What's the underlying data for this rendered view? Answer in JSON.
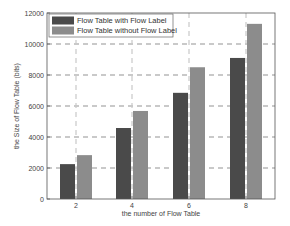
{
  "chart_data": {
    "type": "bar",
    "title": "",
    "xlabel": "the number of Flow Table",
    "ylabel": "the Size of Flow Table (bits)",
    "categories": [
      "2",
      "4",
      "6",
      "8"
    ],
    "series": [
      {
        "name": "Flow Table with Flow Label",
        "color": "#4a4a4a",
        "values": [
          2250,
          4580,
          6850,
          9100
        ]
      },
      {
        "name": "Flow Table without Flow Label",
        "color": "#8c8c8c",
        "values": [
          2830,
          5680,
          8500,
          11300
        ]
      }
    ],
    "ylim": [
      0,
      12000
    ],
    "yticks": [
      "0",
      "2000",
      "4000",
      "6000",
      "8000",
      "10000",
      "12000"
    ],
    "grid": true,
    "legend_position": "upper left"
  }
}
